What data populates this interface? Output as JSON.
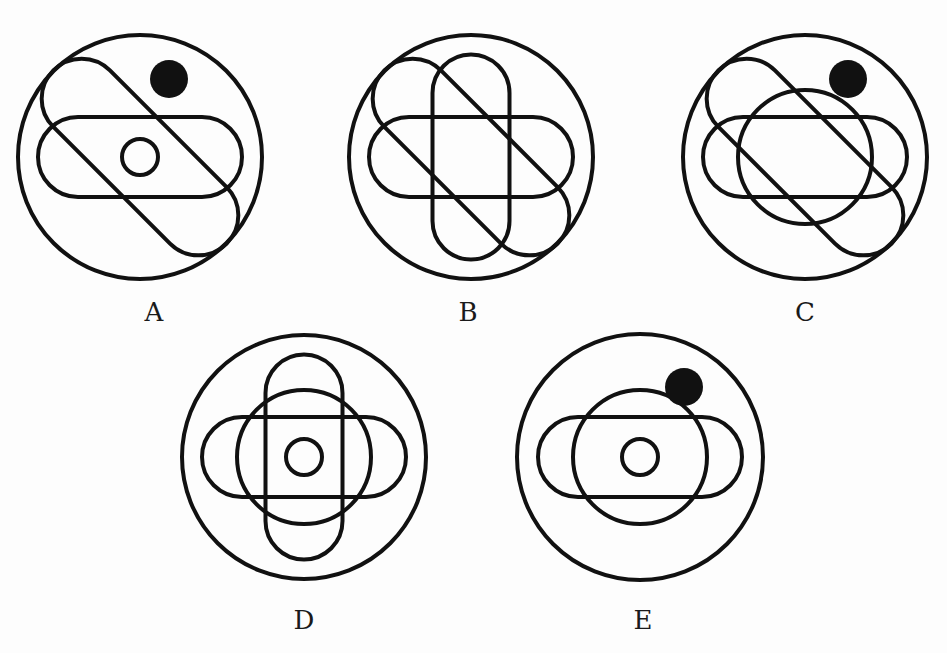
{
  "diagram": {
    "stroke_color": "#111111",
    "fill_color": "#111111",
    "background": "#fdfdfd",
    "stroke_width": 4,
    "figures": [
      {
        "label": "A",
        "center": [
          140,
          157
        ],
        "label_pos": [
          154,
          312
        ],
        "outer_circle_r": 122,
        "horizontal_pill": true,
        "vertical_pill": false,
        "diagonal_pill": true,
        "medium_circle": false,
        "small_circle": true,
        "filled_dot": true,
        "dot_offset": [
          29,
          -78
        ]
      },
      {
        "label": "B",
        "center": [
          471,
          157
        ],
        "label_pos": [
          468,
          312
        ],
        "outer_circle_r": 122,
        "horizontal_pill": true,
        "vertical_pill": true,
        "diagonal_pill": true,
        "medium_circle": false,
        "small_circle": false,
        "filled_dot": false,
        "dot_offset": [
          0,
          0
        ]
      },
      {
        "label": "C",
        "center": [
          805,
          157
        ],
        "label_pos": [
          805,
          312
        ],
        "outer_circle_r": 122,
        "horizontal_pill": true,
        "vertical_pill": false,
        "diagonal_pill": true,
        "medium_circle": true,
        "small_circle": false,
        "filled_dot": true,
        "dot_offset": [
          43,
          -78
        ]
      },
      {
        "label": "D",
        "center": [
          304,
          457
        ],
        "label_pos": [
          304,
          620
        ],
        "outer_circle_r": 122,
        "horizontal_pill": true,
        "vertical_pill": true,
        "diagonal_pill": false,
        "medium_circle": true,
        "small_circle": true,
        "filled_dot": false,
        "dot_offset": [
          0,
          0
        ]
      },
      {
        "label": "E",
        "center": [
          640,
          457
        ],
        "label_pos": [
          643,
          620
        ],
        "outer_circle_r": 123,
        "horizontal_pill": true,
        "vertical_pill": false,
        "diagonal_pill": false,
        "medium_circle": true,
        "small_circle": true,
        "filled_dot": true,
        "dot_offset": [
          44,
          -70
        ]
      }
    ],
    "shape_sizes": {
      "horizontal_pill": {
        "w": 204,
        "h": 80
      },
      "vertical_pill": {
        "w": 77,
        "h": 205
      },
      "diagonal_pill": {
        "w": 80,
        "h": 245,
        "angle": -45
      },
      "medium_circle_r": 67,
      "small_circle_r": 18,
      "dot_r": 19
    }
  }
}
